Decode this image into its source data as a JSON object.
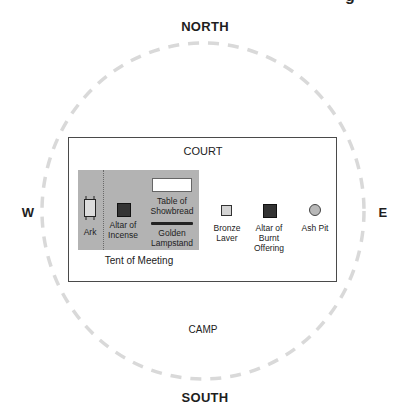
{
  "title_fragment": "g",
  "directions": {
    "north": "NORTH",
    "south": "SOUTH",
    "west": "W",
    "east": "E"
  },
  "regions": {
    "camp": "CAMP",
    "court": "COURT",
    "tent": "Tent of Meeting"
  },
  "items": {
    "ark": {
      "label": "Ark"
    },
    "altar_incense": {
      "label_line1": "Altar of",
      "label_line2": "Incense"
    },
    "table_showbread": {
      "label_line1": "Table of",
      "label_line2": "Showbread"
    },
    "golden_lampstand": {
      "label_line1": "Golden",
      "label_line2": "Lampstand"
    },
    "bronze_laver": {
      "label_line1": "Bronze",
      "label_line2": "Laver"
    },
    "altar_burnt": {
      "label_line1": "Altar of",
      "label_line2": "Burnt",
      "label_line3": "Offering"
    },
    "ash_pit": {
      "label": "Ash Pit"
    }
  },
  "colors": {
    "camp_circle": "#d9d9d9",
    "tent_fill": "#b3b3b3",
    "altar_fill": "#333333",
    "ash_pit_fill": "#b8b8b8",
    "laver_fill": "#d4d4d4"
  }
}
